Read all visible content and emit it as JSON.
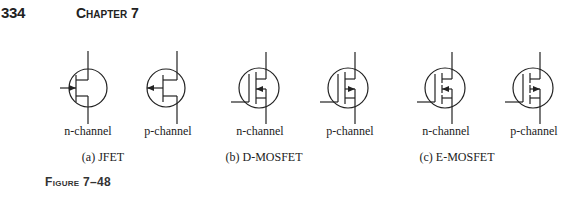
{
  "header": {
    "page_number": "334",
    "chapter": "Chapter 7"
  },
  "figure": {
    "label": "Figure 7–48",
    "groups": [
      {
        "caption": "(a) JFET",
        "symbols": [
          {
            "type": "jfet",
            "channel": "n",
            "label": "n-channel"
          },
          {
            "type": "jfet",
            "channel": "p",
            "label": "p-channel"
          }
        ]
      },
      {
        "caption": "(b) D-MOSFET",
        "symbols": [
          {
            "type": "d-mosfet",
            "channel": "n",
            "label": "n-channel"
          },
          {
            "type": "d-mosfet",
            "channel": "p",
            "label": "p-channel"
          }
        ]
      },
      {
        "caption": "(c) E-MOSFET",
        "symbols": [
          {
            "type": "e-mosfet",
            "channel": "n",
            "label": "n-channel"
          },
          {
            "type": "e-mosfet",
            "channel": "p",
            "label": "p-channel"
          }
        ]
      }
    ]
  }
}
